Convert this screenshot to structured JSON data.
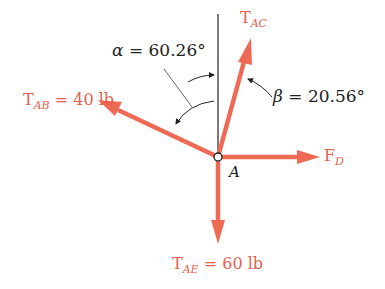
{
  "diagram": {
    "colors": {
      "force": "#ef6a55",
      "force_text": "#e8604c",
      "line": "#222222",
      "background": "#ffffff"
    },
    "point": {
      "label": "A"
    },
    "forces": [
      {
        "id": "TAC",
        "main": "T",
        "sub": "AC",
        "value": ""
      },
      {
        "id": "TAB",
        "main": "T",
        "sub": "AB",
        "value": " = 40 lb"
      },
      {
        "id": "FD",
        "main": "F",
        "sub": "D",
        "value": ""
      },
      {
        "id": "TAE",
        "main": "T",
        "sub": "AE",
        "value": " = 60 lb"
      }
    ],
    "angles": [
      {
        "symbol": "α",
        "text": " = 60.26°"
      },
      {
        "symbol": "β",
        "text": " = 20.56°"
      }
    ]
  }
}
